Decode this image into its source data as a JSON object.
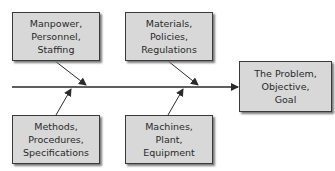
{
  "diagram": {
    "type": "fishbone",
    "effect": {
      "lines": [
        "The Problem,",
        "Objective,",
        "Goal"
      ]
    },
    "causes": [
      {
        "position": "top-left",
        "lines": [
          "Manpower,",
          "Personnel,",
          "Staffing"
        ]
      },
      {
        "position": "top-middle",
        "lines": [
          "Materials,",
          "Policies,",
          "Regulations"
        ]
      },
      {
        "position": "bottom-left",
        "lines": [
          "Methods,",
          "Procedures,",
          "Specifications"
        ]
      },
      {
        "position": "bottom-middle",
        "lines": [
          "Machines,",
          "Plant,",
          "Equipment"
        ]
      }
    ],
    "colors": {
      "box_fill": "#d8d8d8",
      "box_border": "#3a3a3a",
      "line": "#2a2a2a"
    }
  }
}
